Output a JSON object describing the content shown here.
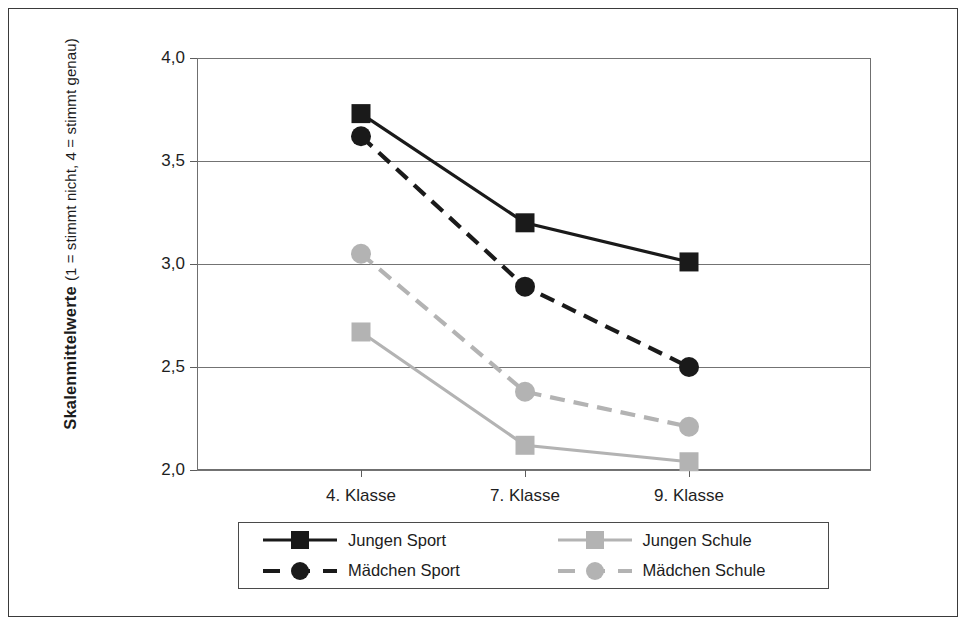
{
  "chart_data": {
    "type": "line",
    "title": "",
    "xlabel": "",
    "ylabel": "Skalenmittelwerte",
    "ylabel_sub": "(1 = stimmt nicht, 4 = stimmt genau)",
    "categories": [
      "4. Klasse",
      "7. Klasse",
      "9. Klasse"
    ],
    "ylim": [
      2.0,
      4.0
    ],
    "yticks": [
      "2,0",
      "2,5",
      "3,0",
      "3,5",
      "4,0"
    ],
    "ytick_values": [
      2.0,
      2.5,
      3.0,
      3.5,
      4.0
    ],
    "grid": true,
    "legend_position": "bottom",
    "series": [
      {
        "name": "Jungen Sport",
        "values": [
          3.73,
          3.2,
          3.01
        ],
        "color": "#1a1a1a",
        "line_style": "solid",
        "marker": "square"
      },
      {
        "name": "Mädchen Sport",
        "values": [
          3.62,
          2.89,
          2.5
        ],
        "color": "#1a1a1a",
        "line_style": "dashed",
        "marker": "circle"
      },
      {
        "name": "Jungen Schule",
        "values": [
          2.67,
          2.12,
          2.04
        ],
        "color": "#b3b3b3",
        "line_style": "solid",
        "marker": "square"
      },
      {
        "name": "Mädchen Schule",
        "values": [
          3.05,
          2.38,
          2.21
        ],
        "color": "#b3b3b3",
        "line_style": "dashed",
        "marker": "circle"
      }
    ]
  },
  "legend": {
    "entries": [
      {
        "label": "Jungen Sport"
      },
      {
        "label": "Jungen Schule"
      },
      {
        "label": "Mädchen Sport"
      },
      {
        "label": "Mädchen Schule"
      }
    ]
  },
  "colors": {
    "dark": "#1a1a1a",
    "light_gray": "#b3b3b3",
    "frame": "#3a3a3a",
    "gridline": "#737373",
    "text": "#1c1c1c"
  }
}
